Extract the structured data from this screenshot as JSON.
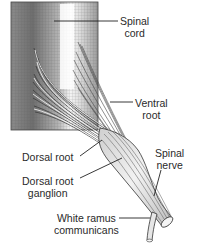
{
  "figure": {
    "type": "anatomical-diagram",
    "ink_color": "#2a2a2a",
    "background": "#ffffff"
  },
  "labels": {
    "spinal_cord": {
      "line1": "Spinal",
      "line2": "cord"
    },
    "ventral_root": {
      "line1": "Ventral",
      "line2": "root"
    },
    "dorsal_root": {
      "line1": "Dorsal root"
    },
    "dorsal_root_ganglion": {
      "line1": "Dorsal root",
      "line2": "ganglion"
    },
    "spinal_nerve": {
      "line1": "Spinal",
      "line2": "nerve"
    },
    "white_ramus": {
      "line1": "White ramus",
      "line2": "communicans"
    }
  }
}
